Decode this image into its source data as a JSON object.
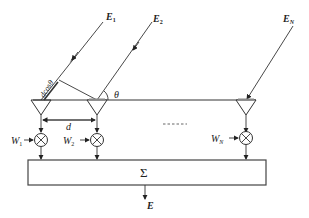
{
  "diagram": {
    "incident_waves": [
      {
        "label": "E",
        "subscript": "1"
      },
      {
        "label": "E",
        "subscript": "2"
      },
      {
        "label": "E",
        "subscript": "N"
      }
    ],
    "angle_label": "θ",
    "path_difference_label": "dcosθ",
    "spacing_label": "d",
    "weights": [
      {
        "label": "W",
        "subscript": "1"
      },
      {
        "label": "W",
        "subscript": "2"
      },
      {
        "label": "W",
        "subscript": "N"
      }
    ],
    "ellipsis": "- - - - - -",
    "summer_label": "Σ",
    "output_label": "E",
    "colors": {
      "stroke": "#333333",
      "background": "#ffffff"
    }
  }
}
